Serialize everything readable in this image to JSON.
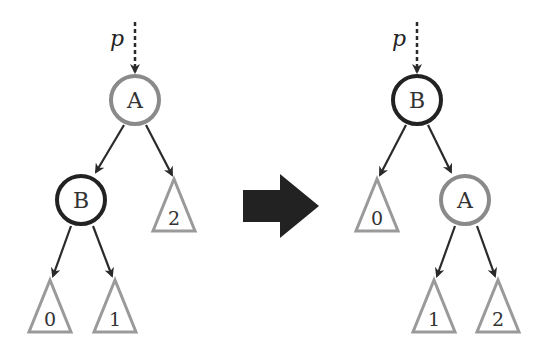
{
  "diagram": {
    "type": "tree-rotation",
    "colors": {
      "black_node": "#222222",
      "gray_node": "#8a8a8a",
      "subtree": "#9a9a9a",
      "edge": "#2a2a2a",
      "transform_arrow": "#222222",
      "text": "#333333"
    },
    "before": {
      "pointer_label": "p",
      "nodes": [
        {
          "id": "A",
          "label": "A",
          "color": "gray",
          "cx": 135,
          "cy": 100
        },
        {
          "id": "B",
          "label": "B",
          "color": "black",
          "cx": 81,
          "cy": 200
        }
      ],
      "subtrees": [
        {
          "label": "0",
          "apex_x": 50,
          "apex_y": 280
        },
        {
          "label": "1",
          "apex_x": 115,
          "apex_y": 280
        },
        {
          "label": "2",
          "apex_x": 174,
          "apex_y": 179
        }
      ]
    },
    "after": {
      "pointer_label": "p",
      "nodes": [
        {
          "id": "B",
          "label": "B",
          "color": "black",
          "cx": 417,
          "cy": 100
        },
        {
          "id": "A",
          "label": "A",
          "color": "gray",
          "cx": 465,
          "cy": 200
        }
      ],
      "subtrees": [
        {
          "label": "0",
          "apex_x": 377,
          "apex_y": 179
        },
        {
          "label": "1",
          "apex_x": 434,
          "apex_y": 280
        },
        {
          "label": "2",
          "apex_x": 498,
          "apex_y": 280
        }
      ]
    }
  }
}
